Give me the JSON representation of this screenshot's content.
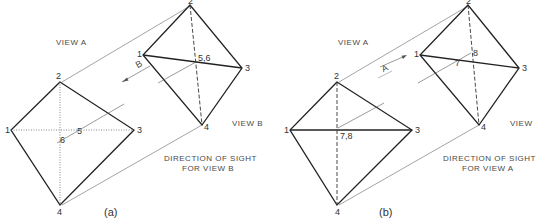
{
  "panels": [
    {
      "id": "a",
      "caption": "(a)",
      "view_a_label": "VIEW A",
      "view_b_label": "VIEW B",
      "direction_line1": "DIRECTION OF SIGHT",
      "direction_line2": "FOR VIEW B",
      "arrow_label": "B",
      "view_a_points": {
        "p1": "1",
        "p2": "2",
        "p3": "3",
        "p4": "4",
        "p5": "5",
        "p6": "6"
      },
      "view_b_points": {
        "p1": "1",
        "p2": "2",
        "p3": "3",
        "p4": "4",
        "p56": "5,6"
      }
    },
    {
      "id": "b",
      "caption": "(b)",
      "view_a_label": "VIEW A",
      "view_b_label": "VIEW",
      "direction_line1": "DIRECTION OF SIGHT",
      "direction_line2": "FOR VIEW A",
      "arrow_label": "A",
      "view_a_points": {
        "p1": "1",
        "p2": "2",
        "p3": "3",
        "p4": "4",
        "p78": "7,8"
      },
      "view_b_points": {
        "p1": "1",
        "p2": "2",
        "p3": "3",
        "p4": "4",
        "p7": "7",
        "p8": "8"
      }
    }
  ],
  "colors": {
    "line": "#222222",
    "thin": "#555555",
    "text": "#4a4a4a"
  }
}
